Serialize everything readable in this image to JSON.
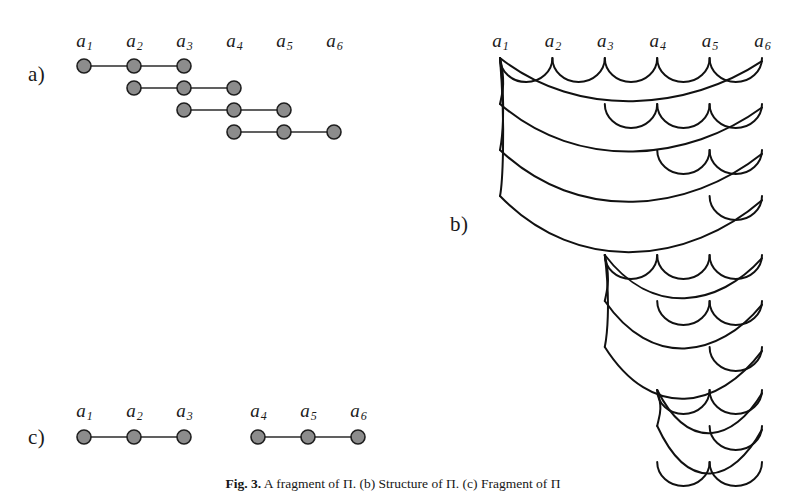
{
  "figure": {
    "width": 786,
    "height": 503,
    "background": "#ffffff",
    "ink_color": "#111111",
    "node_fill": "#8c8c8c",
    "node_stroke": "#1e1e1e"
  },
  "panels": {
    "a": {
      "label": "a)",
      "label_x": 28,
      "label_y": 62,
      "origin_x": 84,
      "col_spacing": 50,
      "label_row_y": 30,
      "first_row_y": 66,
      "row_spacing": 22,
      "node_radius": 7,
      "columns": [
        {
          "id": "a1",
          "base": "a",
          "sub": "1"
        },
        {
          "id": "a2",
          "base": "a",
          "sub": "2"
        },
        {
          "id": "a3",
          "base": "a",
          "sub": "3"
        },
        {
          "id": "a4",
          "base": "a",
          "sub": "4"
        },
        {
          "id": "a5",
          "base": "a",
          "sub": "5"
        },
        {
          "id": "a6",
          "base": "a",
          "sub": "6"
        }
      ],
      "chains": [
        {
          "start": 0,
          "end": 2
        },
        {
          "start": 1,
          "end": 3
        },
        {
          "start": 2,
          "end": 4
        },
        {
          "start": 3,
          "end": 5
        }
      ]
    },
    "b": {
      "label": "b)",
      "label_x": 450,
      "label_y": 212,
      "origin_x": 500,
      "col_spacing": 52.4,
      "label_row_y": 30,
      "first_row_y": 58,
      "columns": [
        {
          "id": "a1",
          "base": "a",
          "sub": "1"
        },
        {
          "id": "a2",
          "base": "a",
          "sub": "2"
        },
        {
          "id": "a3",
          "base": "a",
          "sub": "3"
        },
        {
          "id": "a4",
          "base": "a",
          "sub": "4"
        },
        {
          "id": "a5",
          "base": "a",
          "sub": "5"
        },
        {
          "id": "a6",
          "base": "a",
          "sub": "6"
        }
      ],
      "groups": [
        {
          "name": "group-a1",
          "root": 0,
          "top_y": 58,
          "rows": [
            {
              "y": 58,
              "depth": 22,
              "arcs": [
                [
                  0,
                  1
                ],
                [
                  1,
                  2
                ],
                [
                  2,
                  3
                ],
                [
                  3,
                  4
                ],
                [
                  4,
                  5
                ]
              ],
              "long": [
                [
                  0,
                  5
                ]
              ]
            },
            {
              "y": 104,
              "depth": 22,
              "arcs": [
                [
                  2,
                  3
                ],
                [
                  3,
                  4
                ],
                [
                  4,
                  5
                ]
              ],
              "long": [
                [
                  0,
                  5
                ]
              ]
            },
            {
              "y": 150,
              "depth": 22,
              "arcs": [
                [
                  3,
                  4
                ],
                [
                  4,
                  5
                ]
              ],
              "long": [
                [
                  0,
                  5
                ]
              ]
            },
            {
              "y": 196,
              "depth": 22,
              "arcs": [
                [
                  4,
                  5
                ]
              ],
              "long": [
                [
                  0,
                  5
                ]
              ]
            }
          ]
        },
        {
          "name": "group-a3",
          "root": 2,
          "top_y": 255,
          "rows": [
            {
              "y": 255,
              "depth": 22,
              "arcs": [
                [
                  2,
                  3
                ],
                [
                  3,
                  4
                ],
                [
                  4,
                  5
                ]
              ],
              "long": [
                [
                  2,
                  5
                ]
              ]
            },
            {
              "y": 301,
              "depth": 22,
              "arcs": [
                [
                  3,
                  4
                ],
                [
                  4,
                  5
                ]
              ],
              "long": [
                [
                  2,
                  5
                ]
              ]
            },
            {
              "y": 347,
              "depth": 22,
              "arcs": [
                [
                  4,
                  5
                ]
              ],
              "long": [
                [
                  2,
                  5
                ]
              ]
            }
          ]
        },
        {
          "name": "group-a4",
          "root": 3,
          "top_y": 390,
          "rows": [
            {
              "y": 390,
              "depth": 22,
              "arcs": [
                [
                  3,
                  4
                ],
                [
                  4,
                  5
                ]
              ],
              "long": [
                [
                  3,
                  5
                ]
              ]
            },
            {
              "y": 426,
              "depth": 22,
              "arcs": [
                [
                  4,
                  5
                ]
              ],
              "long": [
                [
                  3,
                  5
                ]
              ]
            }
          ]
        },
        {
          "name": "group-a5",
          "root": 4,
          "top_y": 462,
          "rows": [
            {
              "y": 462,
              "depth": 22,
              "arcs": [
                [
                  3,
                  4
                ],
                [
                  4,
                  5
                ]
              ],
              "long": []
            }
          ]
        }
      ]
    },
    "c": {
      "label": "c)",
      "label_x": 28,
      "label_y": 425,
      "origin_x": 84,
      "col_spacing": 50,
      "group_gap": 24,
      "label_row_y": 400,
      "row_y": 437,
      "node_radius": 7,
      "columns": [
        {
          "id": "a1",
          "base": "a",
          "sub": "1"
        },
        {
          "id": "a2",
          "base": "a",
          "sub": "2"
        },
        {
          "id": "a3",
          "base": "a",
          "sub": "3"
        },
        {
          "id": "a4",
          "base": "a",
          "sub": "4"
        },
        {
          "id": "a5",
          "base": "a",
          "sub": "5"
        },
        {
          "id": "a6",
          "base": "a",
          "sub": "6"
        }
      ],
      "chains": [
        {
          "start": 0,
          "end": 2
        },
        {
          "start": 3,
          "end": 5
        }
      ]
    }
  },
  "caption": {
    "prefix": "Fig. 3.",
    "text": "A fragment of Π. (b) Structure of Π. (c) Fragment of Π"
  }
}
